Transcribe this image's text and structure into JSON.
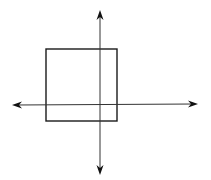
{
  "diagram": {
    "colors": {
      "stroke": "#1a1a1a",
      "axis": "#333333",
      "background": "#ffffff"
    },
    "axes": {
      "horizontal": {
        "x1": 12,
        "y1": 105,
        "x2": 198,
        "y2": 104
      },
      "vertical": {
        "x1": 100,
        "y1": 10,
        "x2": 100,
        "y2": 175
      }
    },
    "square": {
      "x": 46,
      "y": 49,
      "width": 71,
      "height": 72
    }
  }
}
